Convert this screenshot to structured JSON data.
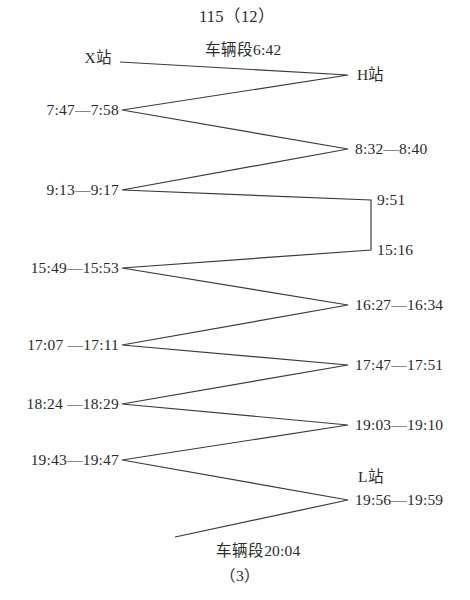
{
  "diagram": {
    "title": "115（12）",
    "footer_count": "（3）",
    "depot_start": "车辆段6:42",
    "depot_end": "车辆段20:04",
    "station_left": "X站",
    "station_right_top": "H站",
    "station_right_bottom": "L站",
    "line_color": "#3a3a3a",
    "background_color": "#ffffff",
    "left_stops": [
      {
        "id": "x-station",
        "label": "X站",
        "x": 112,
        "y": 58
      },
      {
        "id": "stop-0747",
        "label": "7:47—7:58",
        "x": 119,
        "y": 110
      },
      {
        "id": "stop-0913",
        "label": "9:13—9:17",
        "x": 119,
        "y": 190
      },
      {
        "id": "stop-1549",
        "label": "15:49—15:53",
        "x": 119,
        "y": 268
      },
      {
        "id": "stop-1707",
        "label": "17:07 —17:11",
        "x": 119,
        "y": 345
      },
      {
        "id": "stop-1824",
        "label": "18:24 —18:29",
        "x": 119,
        "y": 404
      },
      {
        "id": "stop-1943",
        "label": "19:43—19:47",
        "x": 119,
        "y": 460
      }
    ],
    "right_stops": [
      {
        "id": "h-station",
        "label": "H站",
        "x": 357,
        "y": 75
      },
      {
        "id": "stop-0832",
        "label": "8:32—8:40",
        "x": 355,
        "y": 149
      },
      {
        "id": "stop-0951",
        "label": "9:51",
        "x": 377,
        "y": 200
      },
      {
        "id": "stop-1516",
        "label": "15:16",
        "x": 377,
        "y": 250
      },
      {
        "id": "stop-1627",
        "label": "16:27—16:34",
        "x": 355,
        "y": 305
      },
      {
        "id": "stop-1747",
        "label": "17:47—17:51",
        "x": 355,
        "y": 365
      },
      {
        "id": "stop-1903",
        "label": "19:03—19:10",
        "x": 355,
        "y": 425
      },
      {
        "id": "l-station",
        "label": "L站",
        "x": 358,
        "y": 477
      },
      {
        "id": "stop-1956",
        "label": "19:56—19:59",
        "x": 355,
        "y": 500
      }
    ],
    "annotations": [
      {
        "id": "title",
        "label": "115（12）",
        "x": 237,
        "y": 17
      },
      {
        "id": "depot-start",
        "label": "车辆段6:42",
        "x": 243,
        "y": 50
      },
      {
        "id": "depot-end",
        "label": "车辆段20:04",
        "x": 258,
        "y": 551
      },
      {
        "id": "footer-count",
        "label": "（3）",
        "x": 240,
        "y": 576
      }
    ],
    "route_path": "M120,62 L348,75 L122,110 L348,149 L122,190 L371,200 L371,250 L122,268 L348,305 L122,345 L348,365 L122,404 L348,425 L122,460 L348,500 L175,537"
  }
}
